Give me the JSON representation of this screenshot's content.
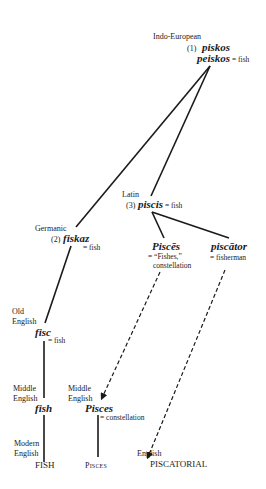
{
  "diagram": {
    "type": "etymology-tree",
    "nodes": {
      "indo_european": {
        "label": "Indo-European",
        "number": "(1)",
        "word1": "piskos",
        "word2": "peiskos",
        "gloss": "= fish"
      },
      "latin": {
        "label": "Latin",
        "number": "(3)",
        "word": "piscis",
        "gloss": "= fish"
      },
      "germanic": {
        "label": "Germanic",
        "number": "(2)",
        "word": "fiskaz",
        "gloss": "= fish"
      },
      "pisces_latin": {
        "word": "Piscēs",
        "gloss1": "= “Fishes,”",
        "gloss2": "constellation"
      },
      "piscator": {
        "word": "piscātor",
        "gloss": "= fisherman"
      },
      "old_english": {
        "label1": "Old",
        "label2": "English",
        "word": "fisc",
        "gloss": "= fish"
      },
      "middle_english_fish": {
        "label1": "Middle",
        "label2": "English",
        "word": "fish"
      },
      "middle_english_pisces": {
        "label1": "Middle",
        "label2": "English",
        "word": "Pisces",
        "gloss": "= constellation"
      },
      "modern_english": {
        "label1": "Modern",
        "label2": "English",
        "word": "FISH"
      },
      "pisces_modern": {
        "word": "Pisces"
      },
      "english_piscatorial": {
        "label": "English",
        "word": "PISCATORIAL"
      }
    },
    "edges": [
      {
        "from": "indo_european",
        "to": "germanic",
        "style": "solid"
      },
      {
        "from": "indo_european",
        "to": "latin",
        "style": "solid"
      },
      {
        "from": "germanic",
        "to": "old_english",
        "style": "solid"
      },
      {
        "from": "old_english",
        "to": "middle_english_fish",
        "style": "solid"
      },
      {
        "from": "middle_english_fish",
        "to": "modern_english",
        "style": "solid"
      },
      {
        "from": "latin",
        "to": "pisces_latin",
        "style": "solid"
      },
      {
        "from": "latin",
        "to": "piscator",
        "style": "solid"
      },
      {
        "from": "pisces_latin",
        "to": "middle_english_pisces",
        "style": "dashed-arrow"
      },
      {
        "from": "middle_english_pisces",
        "to": "pisces_modern",
        "style": "solid"
      },
      {
        "from": "piscator",
        "to": "english_piscatorial",
        "style": "dashed-arrow"
      }
    ]
  }
}
